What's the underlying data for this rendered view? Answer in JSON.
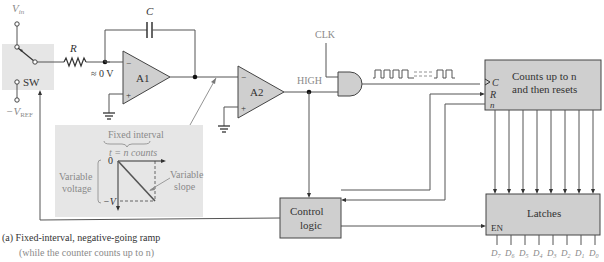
{
  "switch": {
    "vin_label": "V",
    "vin_sub": "in",
    "vref_label": "−V",
    "vref_sub": "REF",
    "sw_label": "SW"
  },
  "components": {
    "resistor_label": "R",
    "capacitor_label": "C",
    "virtual_ground_label": "≈ 0 V",
    "opamp1_label": "A1",
    "opamp2_label": "A2",
    "opamp_minus": "−",
    "opamp_plus": "+",
    "high_label": "HIGH",
    "clk_label": "CLK"
  },
  "counter": {
    "line1": "Counts up to n",
    "line2": "and then resets",
    "pin_c": "C",
    "pin_r": "R",
    "pin_n": "n"
  },
  "latches": {
    "label": "Latches",
    "pin_en": "EN",
    "outputs": [
      "D7",
      "D6",
      "D5",
      "D4",
      "D3",
      "D2",
      "D1",
      "D0"
    ]
  },
  "control": {
    "line1": "Control",
    "line2": "logic"
  },
  "inset": {
    "title": "Fixed interval",
    "formula": "t = n counts",
    "zero_label": "0",
    "neg_v_label": "−V",
    "left_line1": "Variable",
    "left_line2": "voltage",
    "right_line1": "Variable",
    "right_line2": "slope"
  },
  "caption": {
    "line1": "(a)  Fixed-interval, negative-going ramp",
    "line2": "(while the counter counts up to n)"
  }
}
